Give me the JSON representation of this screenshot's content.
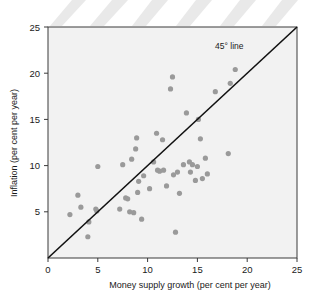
{
  "chart_data": {
    "type": "scatter",
    "title": "",
    "xlabel": "Money supply growth (per cent per year)",
    "ylabel": "Inflation (per cent per year)",
    "xlim": [
      0,
      25
    ],
    "ylim": [
      0,
      25
    ],
    "xticks": [
      0,
      5,
      10,
      15,
      20,
      25
    ],
    "yticks": [
      5,
      10,
      15,
      20,
      25
    ],
    "xtick_labels": [
      "0",
      "5",
      "10",
      "15",
      "20",
      "25"
    ],
    "ytick_labels": [
      "5",
      "10",
      "15",
      "20",
      "25"
    ],
    "grid": false,
    "legend": "none",
    "annotations": [
      {
        "text": "45° line",
        "x": 18.2,
        "y": 22.6,
        "describes": "reference-line"
      }
    ],
    "reference_line": {
      "name": "45° line",
      "type": "identity",
      "from": [
        0,
        0
      ],
      "to": [
        25,
        25
      ],
      "color": "#111111"
    },
    "point_color": "#9a9a9a",
    "point_radius": 2.6,
    "points": [
      [
        2.2,
        4.7
      ],
      [
        3.0,
        6.8
      ],
      [
        3.3,
        5.5
      ],
      [
        4.0,
        2.3
      ],
      [
        4.1,
        3.9
      ],
      [
        4.8,
        5.3
      ],
      [
        4.9,
        5.1
      ],
      [
        5.0,
        9.9
      ],
      [
        7.2,
        5.3
      ],
      [
        7.5,
        10.1
      ],
      [
        7.8,
        6.5
      ],
      [
        8.0,
        6.4
      ],
      [
        8.2,
        5.0
      ],
      [
        8.4,
        10.7
      ],
      [
        8.6,
        4.9
      ],
      [
        8.8,
        11.8
      ],
      [
        8.9,
        13.0
      ],
      [
        9.0,
        7.1
      ],
      [
        9.1,
        8.3
      ],
      [
        9.4,
        4.2
      ],
      [
        9.6,
        8.9
      ],
      [
        10.2,
        7.5
      ],
      [
        10.6,
        10.4
      ],
      [
        10.9,
        13.5
      ],
      [
        11.0,
        9.5
      ],
      [
        11.2,
        9.4
      ],
      [
        11.5,
        12.8
      ],
      [
        11.6,
        9.5
      ],
      [
        11.9,
        7.8
      ],
      [
        12.3,
        18.3
      ],
      [
        12.5,
        19.6
      ],
      [
        12.6,
        9.0
      ],
      [
        12.8,
        2.8
      ],
      [
        13.0,
        9.3
      ],
      [
        13.2,
        7.0
      ],
      [
        13.6,
        10.1
      ],
      [
        13.9,
        15.7
      ],
      [
        14.2,
        10.4
      ],
      [
        14.3,
        9.3
      ],
      [
        14.5,
        10.1
      ],
      [
        14.8,
        8.4
      ],
      [
        15.0,
        9.9
      ],
      [
        15.1,
        15.0
      ],
      [
        15.3,
        12.9
      ],
      [
        15.5,
        8.6
      ],
      [
        15.8,
        10.8
      ],
      [
        16.0,
        9.1
      ],
      [
        16.8,
        18.0
      ],
      [
        18.1,
        11.3
      ],
      [
        18.3,
        18.9
      ],
      [
        18.8,
        20.4
      ]
    ]
  },
  "decorations": {
    "top_streaks": "diagonal-highlight-bands"
  }
}
